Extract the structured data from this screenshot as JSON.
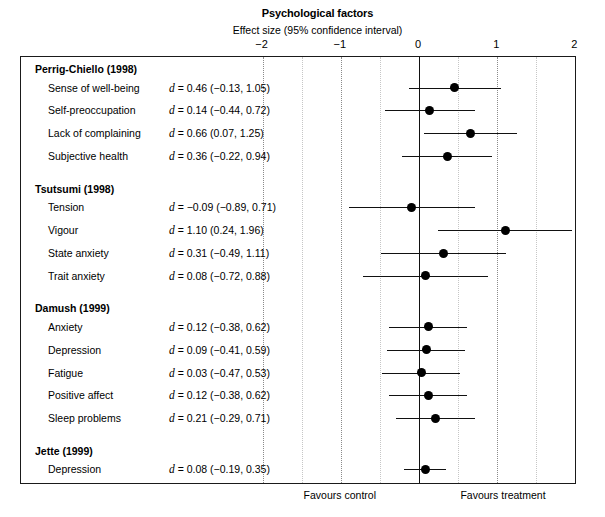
{
  "header": {
    "title": "Psychological factors",
    "subtitle": "Effect size (95% confidence interval)"
  },
  "footer": {
    "favours_control": "Favours control",
    "favours_treatment": "Favours treatment"
  },
  "chart_data": {
    "type": "forest",
    "title": "Psychological factors",
    "subtitle": "Effect size (95% confidence interval)",
    "xlabel": "Effect size (95% confidence interval)",
    "ylabel": "",
    "xlim": [
      -2,
      2
    ],
    "xticks": [
      -2,
      -1,
      0,
      2
    ],
    "xtick_labels": [
      "−2",
      "−1",
      "0",
      "1",
      "2"
    ],
    "xtick_values": [
      -2,
      -1,
      0,
      1,
      2
    ],
    "gridlines": [
      -2,
      -1.5,
      -1,
      -0.5,
      0.5,
      1,
      1.5
    ],
    "reference_line": 0,
    "grid": true,
    "legend": "none",
    "left_footer_label": "Favours control",
    "right_footer_label": "Favours treatment",
    "groups": [
      {
        "study": "Perrig-Chiello (1998)",
        "rows": [
          {
            "label": "Sense of well-being",
            "stat": "d = 0.46 (−0.13, 1.05)",
            "d": 0.46,
            "lower": -0.13,
            "upper": 1.05
          },
          {
            "label": "Self-preoccupation",
            "stat": "d = 0.14 (−0.44, 0.72)",
            "d": 0.14,
            "lower": -0.44,
            "upper": 0.72
          },
          {
            "label": "Lack of complaining",
            "stat": "d = 0.66 (0.07, 1.25)",
            "d": 0.66,
            "lower": 0.07,
            "upper": 1.25
          },
          {
            "label": "Subjective health",
            "stat": "d = 0.36 (−0.22, 0.94)",
            "d": 0.36,
            "lower": -0.22,
            "upper": 0.94
          }
        ]
      },
      {
        "study": "Tsutsumi (1998)",
        "rows": [
          {
            "label": "Tension",
            "stat": "d = −0.09 (−0.89, 0.71)",
            "d": -0.09,
            "lower": -0.89,
            "upper": 0.71
          },
          {
            "label": "Vigour",
            "stat": "d = 1.10 (0.24, 1.96)",
            "d": 1.1,
            "lower": 0.24,
            "upper": 1.96
          },
          {
            "label": "State anxiety",
            "stat": "d = 0.31 (−0.49, 1.11)",
            "d": 0.31,
            "lower": -0.49,
            "upper": 1.11
          },
          {
            "label": "Trait anxiety",
            "stat": "d = 0.08 (−0.72, 0.88)",
            "d": 0.08,
            "lower": -0.72,
            "upper": 0.88
          }
        ]
      },
      {
        "study": "Damush (1999)",
        "rows": [
          {
            "label": "Anxiety",
            "stat": "d = 0.12 (−0.38, 0.62)",
            "d": 0.12,
            "lower": -0.38,
            "upper": 0.62
          },
          {
            "label": "Depression",
            "stat": "d = 0.09 (−0.41, 0.59)",
            "d": 0.09,
            "lower": -0.41,
            "upper": 0.59
          },
          {
            "label": "Fatigue",
            "stat": "d = 0.03 (−0.47, 0.53)",
            "d": 0.03,
            "lower": -0.47,
            "upper": 0.53
          },
          {
            "label": "Positive affect",
            "stat": "d = 0.12 (−0.38, 0.62)",
            "d": 0.12,
            "lower": -0.38,
            "upper": 0.62
          },
          {
            "label": "Sleep problems",
            "stat": "d = 0.21 (−0.29, 0.71)",
            "d": 0.21,
            "lower": -0.29,
            "upper": 0.71
          }
        ]
      },
      {
        "study": "Jette (1999)",
        "rows": [
          {
            "label": "Depression",
            "stat": "d = 0.08 (−0.19, 0.35)",
            "d": 0.08,
            "lower": -0.19,
            "upper": 0.35
          },
          {
            "label": "Anger",
            "stat": "d = 0.06 (−0.21, 0.33)",
            "d": 0.06,
            "lower": -0.21,
            "upper": 0.33
          },
          {
            "label": "Tension",
            "stat": "d = −0.05 (−0.32, 0.22)",
            "d": -0.05,
            "lower": -0.32,
            "upper": 0.22
          },
          {
            "label": "Confusion",
            "stat": "d = 0.02 (−0.25, 0.29)",
            "d": 0.02,
            "lower": -0.25,
            "upper": 0.29
          },
          {
            "label": "Vigour",
            "stat": "d = −0.18 (−0.45, 0.09)",
            "d": -0.18,
            "lower": -0.45,
            "upper": 0.09
          },
          {
            "label": "Fatigue",
            "stat": "d = −0.20 (−0.47, 0.07)",
            "d": -0.2,
            "lower": -0.47,
            "upper": 0.07
          }
        ]
      }
    ]
  }
}
